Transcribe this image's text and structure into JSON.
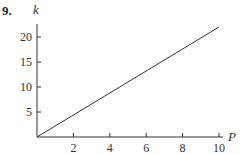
{
  "problem": {
    "number": "9."
  },
  "chart_data": {
    "type": "line",
    "title": "",
    "xlabel": "P",
    "ylabel": "k",
    "xlim": [
      0,
      10
    ],
    "ylim": [
      0,
      22
    ],
    "grid": false,
    "legend": null,
    "x_ticks": [
      2,
      4,
      6,
      8,
      10
    ],
    "y_ticks": [
      5,
      10,
      15,
      20
    ],
    "x_tick_labels": [
      "2",
      "4",
      "6",
      "8",
      "10"
    ],
    "y_tick_labels": [
      "5",
      "10",
      "15",
      "20"
    ],
    "series": [
      {
        "name": "k vs P",
        "x": [
          0,
          10
        ],
        "y": [
          0,
          22
        ],
        "color": "#333333"
      }
    ]
  },
  "colors": {
    "line": "#333333",
    "axis": "#333333"
  }
}
